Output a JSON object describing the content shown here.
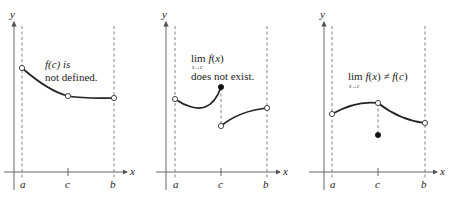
{
  "figure": {
    "panels": [
      {
        "id": "panel-1",
        "caption_line1": "f(c) is",
        "caption_line2": "not defined.",
        "axis_labels": {
          "x": "x",
          "y": "y"
        },
        "tick_labels": {
          "a": "a",
          "c": "c",
          "b": "b"
        }
      },
      {
        "id": "panel-2",
        "caption_lim": "lim f(x)",
        "caption_sub": "x→c",
        "caption_line2": "does not exist.",
        "axis_labels": {
          "x": "x",
          "y": "y"
        },
        "tick_labels": {
          "a": "a",
          "c": "c",
          "b": "b"
        }
      },
      {
        "id": "panel-3",
        "caption_lim": "lim f(x) ≠ f(c)",
        "caption_sub": "x→c",
        "axis_labels": {
          "x": "x",
          "y": "y"
        },
        "tick_labels": {
          "a": "a",
          "c": "c",
          "b": "b"
        }
      }
    ]
  }
}
